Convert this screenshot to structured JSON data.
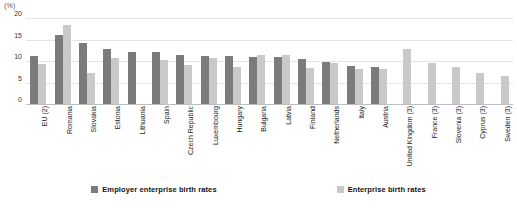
{
  "chart_data": {
    "type": "bar",
    "title": "",
    "subtitle": "",
    "xlabel": "",
    "ylabel": "(%)",
    "unit_label": "(%)",
    "ylim": [
      0,
      20
    ],
    "yticks": [
      0,
      5,
      10,
      15,
      20
    ],
    "ytick_labels": [
      "0",
      "5",
      "10",
      "15",
      "20"
    ],
    "grid": true,
    "grid_axis": "y",
    "legend_position": "bottom",
    "categories": [
      "EU (2)",
      "Romania",
      "Slovakia",
      "Estonia",
      "Lithuania",
      "Spain",
      "Czech Republic",
      "Luxembourg",
      "Hungary",
      "Bulgaria",
      "Latvia",
      "Finland",
      "Netherlands",
      "Italy",
      "Austria",
      "United Kingdom (3)",
      "France (3)",
      "Slovenia (3)",
      "Cyprus (3)",
      "Sweden (3)"
    ],
    "series": [
      {
        "name": "Employer enterprise birth rates",
        "color": "#7b7b7b",
        "values": [
          11.2,
          16.0,
          14.2,
          12.8,
          12.2,
          12.2,
          11.5,
          11.2,
          11.1,
          11.0,
          11.0,
          10.5,
          9.8,
          8.8,
          8.5,
          null,
          null,
          null,
          null,
          null
        ]
      },
      {
        "name": "Enterprise birth rates",
        "color": "#c9c9c9",
        "values": [
          9.2,
          18.3,
          7.1,
          10.8,
          null,
          10.2,
          9.1,
          10.6,
          8.6,
          11.5,
          11.5,
          8.4,
          9.6,
          8.2,
          8.2,
          12.7,
          9.6,
          8.6,
          7.1,
          6.5
        ]
      }
    ]
  },
  "legend": {
    "items": [
      {
        "label": "Employer enterprise birth rates",
        "color": "#7b7b7b"
      },
      {
        "label": "Enterprise birth rates",
        "color": "#c9c9c9"
      }
    ]
  },
  "colors": {
    "series_dark": "#7b7b7b",
    "series_light": "#c9c9c9",
    "gridline": "#e4e4e4",
    "baseline": "#bdbdbd",
    "background": "#ffffff",
    "text": "#1a1a1a"
  }
}
